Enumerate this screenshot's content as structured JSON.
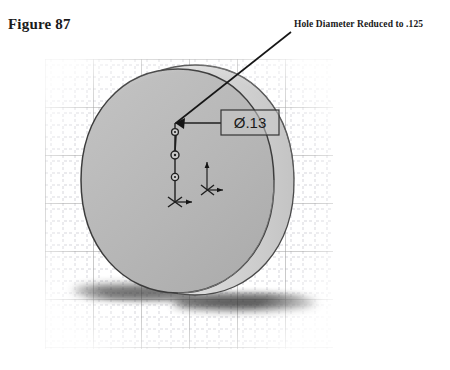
{
  "figure": {
    "caption": "Figure 87",
    "annotation": "Hole Diameter Reduced to .125"
  },
  "cad": {
    "dimension_callout": "Ø.13",
    "model": {
      "shape": "cylindrical-disc",
      "face_fill": "#b9b9b9",
      "wall_fill": "#cfcfcf",
      "outline": "#3a3a3a",
      "shadow": "#2c2c2c"
    },
    "grid": {
      "major_color": "#9a9a9a",
      "minor_color": "#b9b9c4",
      "major_spacing": 48,
      "minor_spacing": 12
    },
    "sketch": {
      "line_color": "#1e1e1e",
      "point_markers": 3,
      "origin_marker": "coordinate-axes"
    }
  }
}
